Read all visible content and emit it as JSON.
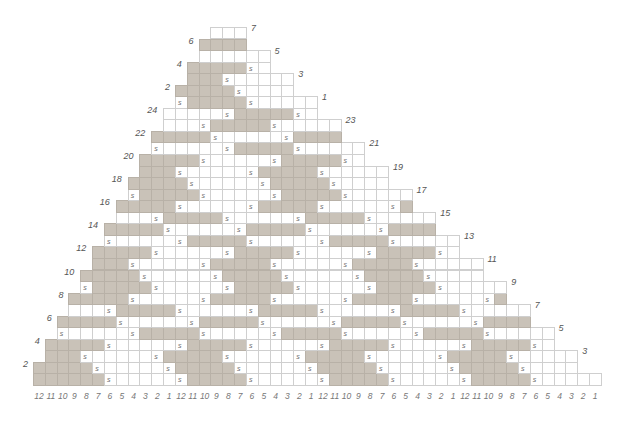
{
  "chart": {
    "type": "stitch-grid",
    "total_columns": 48,
    "total_rows": 31,
    "column_labels": [
      "12",
      "11",
      "10",
      "9",
      "8",
      "7",
      "6",
      "5",
      "4",
      "3",
      "2",
      "1",
      "12",
      "11",
      "10",
      "9",
      "8",
      "7",
      "6",
      "5",
      "4",
      "3",
      "2",
      "1",
      "12",
      "11",
      "10",
      "9",
      "8",
      "7",
      "6",
      "5",
      "4",
      "3",
      "2",
      "1",
      "12",
      "11",
      "10",
      "9",
      "8",
      "7",
      "6",
      "5",
      "4",
      "3",
      "2",
      "1"
    ],
    "stitch_symbol": "s",
    "colors": {
      "shaded": "#c9c2b8",
      "empty": "#ffffff",
      "grid": "#cfcfcf",
      "text": "#666666"
    },
    "rows": [
      {
        "n": 1,
        "label": "",
        "side": "",
        "a": 0,
        "override": {
          "0": "#"
        }
      },
      {
        "n": 2,
        "label": "2",
        "side": "left",
        "a": 11
      },
      {
        "n": 3,
        "label": "3",
        "side": "right",
        "a": 10
      },
      {
        "n": 4,
        "label": "4",
        "side": "left",
        "a": 0
      },
      {
        "n": 5,
        "label": "5",
        "side": "right",
        "a": 8
      },
      {
        "n": 6,
        "label": "6",
        "side": "left",
        "a": 1
      },
      {
        "n": 7,
        "label": "7",
        "side": "right",
        "a": 6
      },
      {
        "n": 8,
        "label": "8",
        "side": "left",
        "a": 2
      },
      {
        "n": 9,
        "label": "9",
        "side": "right",
        "a": 4
      },
      {
        "n": 10,
        "label": "10",
        "side": "left",
        "a": 3
      },
      {
        "n": 11,
        "label": "11",
        "side": "right",
        "a": 2
      },
      {
        "n": 12,
        "label": "12",
        "side": "left",
        "a": 4
      },
      {
        "n": 13,
        "label": "13",
        "side": "right",
        "a": 0
      },
      {
        "n": 14,
        "label": "14",
        "side": "left",
        "a": 5
      },
      {
        "n": 15,
        "label": "15",
        "side": "right",
        "a": 10
      },
      {
        "n": 16,
        "label": "16",
        "side": "left",
        "a": 6
      },
      {
        "n": 17,
        "label": "17",
        "side": "right",
        "a": 8
      },
      {
        "n": 18,
        "label": "18",
        "side": "left",
        "a": 7
      },
      {
        "n": 19,
        "label": "19",
        "side": "right",
        "a": 6
      },
      {
        "n": 20,
        "label": "20",
        "side": "left",
        "a": 8
      },
      {
        "n": 21,
        "label": "21",
        "side": "right",
        "a": 4
      },
      {
        "n": 22,
        "label": "22",
        "side": "left",
        "a": 9
      },
      {
        "n": 23,
        "label": "23",
        "side": "right",
        "a": 2
      },
      {
        "n": 24,
        "label": "24",
        "side": "left",
        "a": 4
      },
      {
        "n": 25,
        "label": "1",
        "side": "right",
        "a": 0
      },
      {
        "n": 26,
        "label": "2",
        "side": "left",
        "a": 11
      },
      {
        "n": 27,
        "label": "3",
        "side": "right",
        "a": 10
      },
      {
        "n": 28,
        "label": "4",
        "side": "left",
        "a": 0
      },
      {
        "n": 29,
        "label": "5",
        "side": "right",
        "a": -1
      },
      {
        "n": 30,
        "label": "6",
        "side": "left",
        "a": 1
      },
      {
        "n": 31,
        "label": "7",
        "side": "right",
        "a": -1
      }
    ]
  }
}
